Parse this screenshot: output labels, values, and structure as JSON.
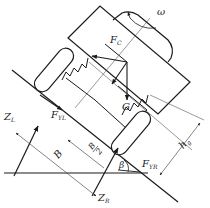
{
  "diagram": {
    "type": "vehicle-roll-free-body-diagram",
    "colors": {
      "stroke": "#1a1a1a",
      "thin": "#333333",
      "background": "#ffffff"
    },
    "labels": {
      "omega": "ω",
      "fc_main": "F",
      "fc_sub": "C",
      "g": "G",
      "fyl_main": "F",
      "fyl_sub": "YL",
      "fyr_main": "F",
      "fyr_sub": "YR",
      "zl_main": "Z",
      "zl_sub": "L",
      "zr_main": "Z",
      "zr_sub": "R",
      "b": "B",
      "b_half_num": "B",
      "b_half_den": "2",
      "hg_main": "h",
      "hg_sub": "g",
      "beta": "β"
    },
    "components": [
      "vehicle-body",
      "cab-top",
      "left-wheel",
      "right-wheel",
      "left-spring",
      "right-spring",
      "ground-line",
      "inclined-road",
      "force-vectors",
      "dimension-lines"
    ]
  }
}
